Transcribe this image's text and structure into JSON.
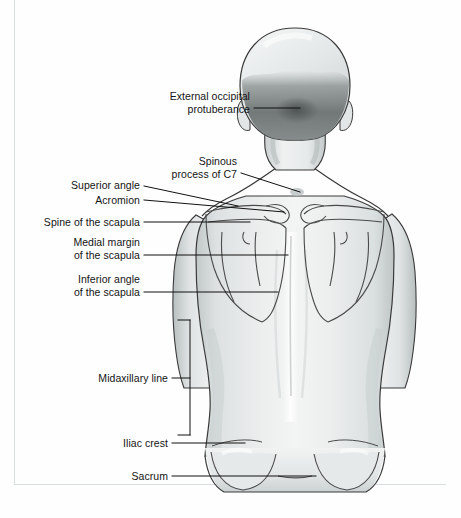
{
  "figure": {
    "view": "posterior",
    "palette": {
      "skin_light": "#eceeee",
      "skin_mid": "#d8dcdc",
      "skin_shadow": "#b9bfbf",
      "hair_dark": "#6f7474",
      "outline": "#3a3a3a",
      "leader": "#111111",
      "page_rule": "#d8dde3",
      "background": "#ffffff",
      "text": "#141414"
    }
  },
  "labels": [
    {
      "id": "external-occipital-protuberance",
      "lines": [
        "External occipital",
        "protuberance"
      ],
      "line1": "External occipital",
      "line2": "protuberance",
      "text_right_px": 250,
      "text_top_px": 90,
      "leader_from": [
        254,
        108
      ],
      "leader_to": [
        300,
        108
      ]
    },
    {
      "id": "spinous-process-of-c7",
      "lines": [
        "Spinous",
        "process of C7"
      ],
      "line1": "Spinous",
      "line2": "process of C7",
      "text_right_px": 237,
      "text_top_px": 155,
      "leader_from": [
        241,
        173
      ],
      "leader_to": [
        300,
        192
      ]
    },
    {
      "id": "superior-angle",
      "lines": [
        "Superior angle"
      ],
      "line1": "Superior angle",
      "text_right_px": 140,
      "text_top_px": 177,
      "leader_from": [
        144,
        186
      ],
      "leader_to": [
        238,
        206
      ]
    },
    {
      "id": "acromion",
      "lines": [
        "Acromion"
      ],
      "line1": "Acromion",
      "text_right_px": 140,
      "text_top_px": 193,
      "leader_from": [
        144,
        200
      ],
      "leader_to": [
        228,
        200
      ]
    },
    {
      "id": "spine-of-the-scapula",
      "lines": [
        "Spine of the scapula"
      ],
      "line1": "Spine of the scapula",
      "text_right_px": 140,
      "text_top_px": 216,
      "leader_from": [
        144,
        222
      ],
      "leader_to": [
        232,
        222
      ]
    },
    {
      "id": "medial-margin-of-the-scapula",
      "lines": [
        "Medial margin",
        "of the scapula"
      ],
      "line1": "Medial margin",
      "line2": "of the scapula",
      "text_right_px": 140,
      "text_top_px": 235,
      "leader_from": [
        144,
        255
      ],
      "leader_to": [
        288,
        255
      ]
    },
    {
      "id": "inferior-angle-of-the-scapula",
      "lines": [
        "Inferior angle",
        "of the scapula"
      ],
      "line1": "Inferior angle",
      "line2": "of the scapula",
      "text_right_px": 140,
      "text_top_px": 272,
      "leader_from": [
        144,
        292
      ],
      "leader_to": [
        278,
        292
      ]
    },
    {
      "id": "midaxillary-line",
      "lines": [
        "Midaxillary line"
      ],
      "line1": "Midaxillary line",
      "text_right_px": 168,
      "text_top_px": 372,
      "leader_from": [
        172,
        378
      ],
      "leader_to": [
        190,
        378
      ],
      "bracket": [
        190,
        320,
        190,
        435
      ]
    },
    {
      "id": "iliac-crest",
      "lines": [
        "Iliac crest"
      ],
      "line1": "Iliac crest",
      "text_right_px": 168,
      "text_top_px": 437,
      "leader_from": [
        172,
        443
      ],
      "leader_to": [
        245,
        443
      ]
    },
    {
      "id": "sacrum",
      "lines": [
        "Sacrum"
      ],
      "line1": "Sacrum",
      "text_right_px": 168,
      "text_top_px": 470,
      "leader_from": [
        172,
        476
      ],
      "leader_to": [
        316,
        476
      ]
    }
  ]
}
